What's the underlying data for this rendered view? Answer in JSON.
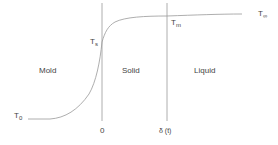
{
  "diagram": {
    "regions": {
      "mold": "Mold",
      "solid": "Solid",
      "liquid": "Liquid"
    },
    "temperatures": {
      "t0": {
        "main": "T",
        "sub": "0"
      },
      "ts": {
        "main": "T",
        "sub": "s"
      },
      "tm": {
        "main": "T",
        "sub": "m"
      },
      "tinf": {
        "main": "T",
        "sub": "∞"
      }
    },
    "axis": {
      "origin": "0",
      "interface": "δ (t)"
    },
    "colors": {
      "line": "#8a8a8a",
      "text": "#444444"
    }
  }
}
